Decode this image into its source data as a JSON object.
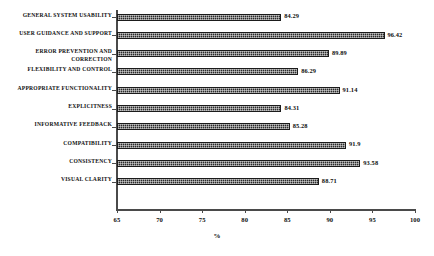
{
  "chart_data": {
    "type": "bar",
    "orientation": "horizontal",
    "title": "",
    "xlabel": "%",
    "ylabel": "",
    "xlim": [
      65,
      100
    ],
    "xticks": [
      65,
      70,
      75,
      80,
      85,
      90,
      95,
      100
    ],
    "grid": false,
    "legend": false,
    "categories": [
      "GENERAL SYSTEM USABILITY",
      "USER GUIDANCE AND SUPPORT",
      "ERROR PREVENTION AND CORRECTION",
      "FLEXIBILITY AND CONTROL",
      "APPROPRIATE FUNCTIONALITY",
      "EXPLICITNESS",
      "INFORMATIVE FEEDBACK",
      "COMPATIBILITY",
      "CONSISTENCY",
      "VISUAL CLARITY"
    ],
    "values": [
      84.29,
      96.42,
      89.89,
      86.29,
      91.14,
      84.31,
      85.28,
      91.9,
      93.58,
      88.71
    ],
    "value_labels": [
      "84.29",
      "96.42",
      "89.89",
      "86.29",
      "91.14",
      "84.31",
      "85.28",
      "91.9",
      "93.58",
      "88.71"
    ],
    "bar_color": "#2b2b2b"
  },
  "axis": {
    "tick_labels": [
      "65",
      "70",
      "75",
      "80",
      "85",
      "90",
      "95",
      "100"
    ],
    "x_title": "%"
  }
}
